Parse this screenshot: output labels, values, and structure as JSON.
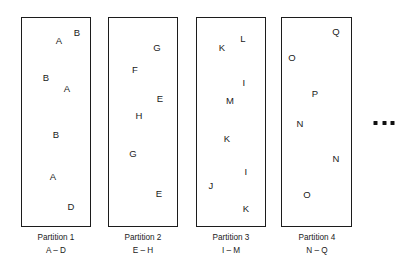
{
  "diagram": {
    "background_color": "#ffffff",
    "border_color": "#1c1c1c",
    "text_color": "#1a1a1a",
    "partitions": [
      {
        "id": "partition-1",
        "caption_title": "Partition 1",
        "caption_range": "A – D",
        "box": {
          "x": 21,
          "y": 17,
          "w": 70,
          "h": 210
        },
        "caption_x": 56,
        "caption_y": 232,
        "letters": [
          {
            "text": "A",
            "x": 59,
            "y": 41
          },
          {
            "text": "B",
            "x": 77,
            "y": 33
          },
          {
            "text": "B",
            "x": 46,
            "y": 78
          },
          {
            "text": "A",
            "x": 67,
            "y": 89
          },
          {
            "text": "B",
            "x": 56,
            "y": 135
          },
          {
            "text": "A",
            "x": 53,
            "y": 177
          },
          {
            "text": "D",
            "x": 71,
            "y": 207
          }
        ]
      },
      {
        "id": "partition-2",
        "caption_title": "Partition 2",
        "caption_range": "E – H",
        "box": {
          "x": 108,
          "y": 17,
          "w": 70,
          "h": 210
        },
        "caption_x": 143,
        "caption_y": 232,
        "letters": [
          {
            "text": "G",
            "x": 157,
            "y": 48
          },
          {
            "text": "F",
            "x": 135,
            "y": 70
          },
          {
            "text": "E",
            "x": 160,
            "y": 99
          },
          {
            "text": "H",
            "x": 139,
            "y": 116
          },
          {
            "text": "G",
            "x": 133,
            "y": 154
          },
          {
            "text": "E",
            "x": 159,
            "y": 194
          }
        ]
      },
      {
        "id": "partition-3",
        "caption_title": "Partition 3",
        "caption_range": "I – M",
        "box": {
          "x": 196,
          "y": 17,
          "w": 70,
          "h": 210
        },
        "caption_x": 231,
        "caption_y": 232,
        "letters": [
          {
            "text": "L",
            "x": 243,
            "y": 39
          },
          {
            "text": "K",
            "x": 222,
            "y": 48
          },
          {
            "text": "I",
            "x": 244,
            "y": 83
          },
          {
            "text": "M",
            "x": 230,
            "y": 101
          },
          {
            "text": "K",
            "x": 227,
            "y": 139
          },
          {
            "text": "I",
            "x": 246,
            "y": 172
          },
          {
            "text": "J",
            "x": 211,
            "y": 186
          },
          {
            "text": "K",
            "x": 246,
            "y": 209
          }
        ]
      },
      {
        "id": "partition-4",
        "caption_title": "Partition 4",
        "caption_range": "N – Q",
        "box": {
          "x": 281,
          "y": 17,
          "w": 71,
          "h": 210
        },
        "caption_x": 317,
        "caption_y": 232,
        "letters": [
          {
            "text": "Q",
            "x": 336,
            "y": 32
          },
          {
            "text": "O",
            "x": 292,
            "y": 58
          },
          {
            "text": "P",
            "x": 315,
            "y": 94
          },
          {
            "text": "N",
            "x": 300,
            "y": 124
          },
          {
            "text": "N",
            "x": 336,
            "y": 159
          },
          {
            "text": "O",
            "x": 307,
            "y": 195
          }
        ]
      }
    ],
    "ellipsis": {
      "label": "more partitions",
      "dots": 3,
      "x": 384,
      "y": 123
    }
  }
}
